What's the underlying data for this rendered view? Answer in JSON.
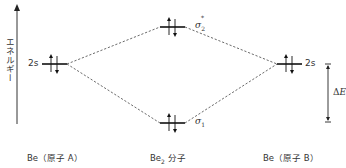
{
  "diagram": {
    "type": "molecular-orbital-energy-diagram",
    "axis": {
      "label": "エネルギー",
      "direction": "up"
    },
    "atom_a": {
      "orbital_label": "2s",
      "caption": "Be（原子 A）",
      "electrons": "up-down pair"
    },
    "atom_b": {
      "orbital_label": "2s",
      "caption": "Be（原子 B）",
      "electrons": "up-down pair"
    },
    "molecule": {
      "caption_main": "Be",
      "caption_sub": "2",
      "caption_suffix": " 分子",
      "orbitals": [
        {
          "name": "sigma2-star",
          "symbol": "σ",
          "sub": "2",
          "sup": "*",
          "electrons": "up-down pair",
          "level": "antibonding"
        },
        {
          "name": "sigma1",
          "symbol": "σ",
          "sub": "1",
          "sup": "",
          "electrons": "up-down pair",
          "level": "bonding"
        }
      ]
    },
    "energy_gap": {
      "symbol": "Δ",
      "var": "E"
    },
    "colors": {
      "line": "#222222",
      "dashed": "#444444",
      "text": "#333333"
    }
  }
}
